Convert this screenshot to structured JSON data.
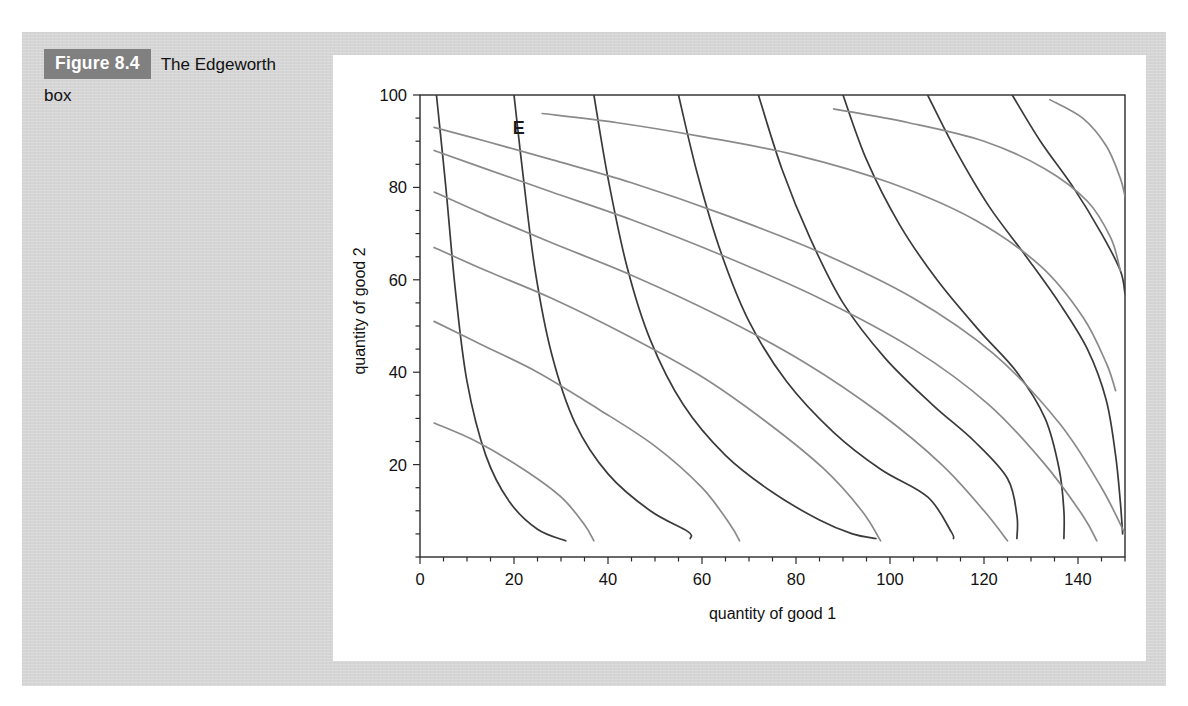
{
  "page": {
    "background_color": "#ffffff",
    "panel_color": "#d5d5d5",
    "card_color": "#ffffff"
  },
  "caption": {
    "figure_tag": "Figure 8.4",
    "figure_tag_bg": "#808080",
    "figure_tag_fg": "#ffffff",
    "title_line1": "The Edgeworth",
    "title_line2": "box"
  },
  "chart_data": {
    "type": "line",
    "title": "",
    "xlabel": "quantity of good 1",
    "ylabel": "quantity of good 2",
    "xlim": [
      0,
      150
    ],
    "ylim": [
      0,
      100
    ],
    "xticks": [
      0,
      20,
      40,
      60,
      80,
      100,
      120,
      140
    ],
    "xticklabels": [
      "0",
      "20",
      "40",
      "60",
      "80",
      "100",
      "120",
      "140"
    ],
    "yticks": [
      20,
      40,
      60,
      80,
      100
    ],
    "yticklabels": [
      "20",
      "40",
      "60",
      "80",
      "100"
    ],
    "xminor_step": 5,
    "yminor_step": 5,
    "grid": false,
    "legend": "none",
    "annotations": [
      {
        "text": "E",
        "x": 21,
        "y": 91.5,
        "color": "#1a1a1a",
        "bold": true
      }
    ],
    "series": [
      {
        "name": "A-indifference-1",
        "role": "consumer-A",
        "color": "#3a3a3a",
        "width": 1.7,
        "points": [
          [
            3.5,
            100
          ],
          [
            5.5,
            80
          ],
          [
            7.5,
            58
          ],
          [
            10,
            38
          ],
          [
            14,
            22
          ],
          [
            19,
            12
          ],
          [
            25,
            6
          ],
          [
            31,
            3.5
          ]
        ]
      },
      {
        "name": "A-indifference-2",
        "role": "consumer-A",
        "color": "#3a3a3a",
        "width": 1.7,
        "points": [
          [
            20,
            100
          ],
          [
            22,
            82
          ],
          [
            24.5,
            62
          ],
          [
            28,
            44
          ],
          [
            33,
            29
          ],
          [
            40,
            18
          ],
          [
            49,
            10
          ],
          [
            57,
            5.5
          ],
          [
            57.5,
            4
          ]
        ]
      },
      {
        "name": "A-indifference-3",
        "role": "consumer-A",
        "color": "#3a3a3a",
        "width": 1.7,
        "points": [
          [
            37,
            100
          ],
          [
            40,
            82
          ],
          [
            44,
            63
          ],
          [
            49,
            47
          ],
          [
            56,
            33
          ],
          [
            65,
            22
          ],
          [
            75,
            14
          ],
          [
            85,
            8
          ],
          [
            92,
            5
          ],
          [
            97,
            4
          ]
        ]
      },
      {
        "name": "A-indifference-4",
        "role": "consumer-A",
        "color": "#3a3a3a",
        "width": 1.7,
        "points": [
          [
            55,
            100
          ],
          [
            59,
            83
          ],
          [
            64,
            66
          ],
          [
            70,
            51
          ],
          [
            78,
            38
          ],
          [
            88,
            27
          ],
          [
            98,
            19
          ],
          [
            108,
            13
          ],
          [
            113,
            5.5
          ],
          [
            113.5,
            4
          ]
        ]
      },
      {
        "name": "A-indifference-5",
        "role": "consumer-A",
        "color": "#3a3a3a",
        "width": 1.7,
        "points": [
          [
            72,
            100
          ],
          [
            77,
            84
          ],
          [
            83,
            69
          ],
          [
            90,
            55
          ],
          [
            99,
            43
          ],
          [
            109,
            33
          ],
          [
            118,
            25
          ],
          [
            125,
            17
          ],
          [
            127,
            9
          ],
          [
            127,
            4
          ]
        ]
      },
      {
        "name": "A-indifference-6",
        "role": "consumer-A",
        "color": "#3a3a3a",
        "width": 1.7,
        "points": [
          [
            90,
            100
          ],
          [
            95,
            86
          ],
          [
            102,
            72
          ],
          [
            110,
            60
          ],
          [
            119,
            49
          ],
          [
            127,
            40
          ],
          [
            133,
            30
          ],
          [
            136,
            19
          ],
          [
            137,
            10
          ],
          [
            137,
            4
          ]
        ]
      },
      {
        "name": "A-indifference-7",
        "role": "consumer-A",
        "color": "#3a3a3a",
        "width": 1.7,
        "points": [
          [
            108,
            100
          ],
          [
            114,
            88
          ],
          [
            121,
            76
          ],
          [
            129,
            65
          ],
          [
            136,
            55
          ],
          [
            142,
            45
          ],
          [
            146,
            34
          ],
          [
            148,
            22
          ],
          [
            149,
            12
          ],
          [
            149.5,
            5
          ]
        ]
      },
      {
        "name": "A-indifference-8",
        "role": "consumer-A",
        "color": "#3a3a3a",
        "width": 1.7,
        "points": [
          [
            126,
            100
          ],
          [
            132,
            90
          ],
          [
            139,
            80
          ],
          [
            145,
            70
          ],
          [
            149,
            62
          ],
          [
            150,
            57
          ]
        ]
      },
      {
        "name": "B-indifference-1",
        "role": "consumer-B",
        "color": "#8a8a8a",
        "width": 1.7,
        "points": [
          [
            3,
            93
          ],
          [
            14,
            90
          ],
          [
            28,
            86
          ],
          [
            45,
            81
          ],
          [
            65,
            74
          ],
          [
            85,
            66
          ],
          [
            105,
            56
          ],
          [
            122,
            44
          ],
          [
            136,
            29
          ],
          [
            145,
            15
          ],
          [
            150,
            5
          ]
        ]
      },
      {
        "name": "B-indifference-2",
        "role": "consumer-B",
        "color": "#8a8a8a",
        "width": 1.7,
        "points": [
          [
            3,
            88
          ],
          [
            14,
            84
          ],
          [
            28,
            79
          ],
          [
            45,
            73
          ],
          [
            65,
            65
          ],
          [
            85,
            56
          ],
          [
            105,
            45
          ],
          [
            121,
            33
          ],
          [
            133,
            20
          ],
          [
            141,
            9
          ],
          [
            144,
            3.5
          ]
        ]
      },
      {
        "name": "B-indifference-3",
        "role": "consumer-B",
        "color": "#8a8a8a",
        "width": 1.7,
        "points": [
          [
            3,
            79
          ],
          [
            14,
            74
          ],
          [
            28,
            68
          ],
          [
            45,
            61
          ],
          [
            64,
            52
          ],
          [
            82,
            42
          ],
          [
            98,
            31
          ],
          [
            111,
            20
          ],
          [
            120,
            10
          ],
          [
            125,
            3.5
          ]
        ]
      },
      {
        "name": "B-indifference-4",
        "role": "consumer-B",
        "color": "#8a8a8a",
        "width": 1.7,
        "points": [
          [
            3,
            67
          ],
          [
            14,
            62
          ],
          [
            28,
            56
          ],
          [
            44,
            48
          ],
          [
            60,
            39
          ],
          [
            74,
            29
          ],
          [
            86,
            19
          ],
          [
            94,
            10
          ],
          [
            98,
            3.5
          ]
        ]
      },
      {
        "name": "B-indifference-5",
        "role": "consumer-B",
        "color": "#8a8a8a",
        "width": 1.7,
        "points": [
          [
            3,
            51
          ],
          [
            13,
            46
          ],
          [
            25,
            40
          ],
          [
            38,
            32
          ],
          [
            50,
            24
          ],
          [
            60,
            15
          ],
          [
            66,
            7
          ],
          [
            68,
            3.5
          ]
        ]
      },
      {
        "name": "B-indifference-6",
        "role": "consumer-B",
        "color": "#8a8a8a",
        "width": 1.7,
        "points": [
          [
            3,
            29
          ],
          [
            12,
            25
          ],
          [
            22,
            19
          ],
          [
            30,
            13
          ],
          [
            35,
            7
          ],
          [
            37,
            3.5
          ]
        ]
      },
      {
        "name": "B-indifference-7",
        "role": "consumer-B",
        "color": "#8a8a8a",
        "width": 1.7,
        "points": [
          [
            26,
            96
          ],
          [
            42,
            94
          ],
          [
            60,
            91
          ],
          [
            80,
            87
          ],
          [
            100,
            81
          ],
          [
            118,
            73
          ],
          [
            132,
            63
          ],
          [
            141,
            52
          ],
          [
            146,
            42
          ],
          [
            148,
            36
          ]
        ]
      },
      {
        "name": "B-indifference-8",
        "role": "consumer-B",
        "color": "#8a8a8a",
        "width": 1.7,
        "points": [
          [
            88,
            97
          ],
          [
            104,
            94
          ],
          [
            120,
            90
          ],
          [
            133,
            84
          ],
          [
            142,
            77
          ],
          [
            147,
            69
          ],
          [
            149,
            62
          ]
        ]
      },
      {
        "name": "B-indifference-9",
        "role": "consumer-B",
        "color": "#8a8a8a",
        "width": 1.7,
        "points": [
          [
            134,
            99
          ],
          [
            141,
            95
          ],
          [
            146,
            89
          ],
          [
            149,
            82
          ],
          [
            150,
            78
          ]
        ]
      }
    ]
  }
}
